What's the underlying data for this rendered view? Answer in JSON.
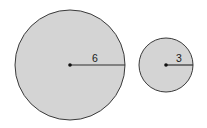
{
  "figure": {
    "background": "#ffffff",
    "fill_color": "#d4d4d4",
    "stroke_color": "#3a3a3a",
    "circles": [
      {
        "name": "large-circle",
        "cx": 70,
        "cy": 65,
        "r": 55,
        "radius_label": "6",
        "label_x": 95,
        "label_y": 62
      },
      {
        "name": "small-circle",
        "cx": 166,
        "cy": 65,
        "r": 27,
        "radius_label": "3",
        "label_x": 179,
        "label_y": 62
      }
    ]
  }
}
